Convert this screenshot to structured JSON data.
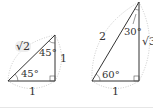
{
  "diagram": {
    "left_triangle": {
      "name": "45-45-90 triangle",
      "hypotenuse": "√2",
      "vertical_side": "1",
      "base": "1",
      "top_angle": "45°",
      "bottom_angle": "45°"
    },
    "right_triangle": {
      "name": "30-60-90 triangle",
      "hypotenuse": "2",
      "vertical_side": "√3",
      "base": "1",
      "top_angle": "30°",
      "bottom_angle": "60°"
    },
    "colors": {
      "line": "#333333",
      "dotted": "#bbbbbb",
      "label": "#333333"
    }
  }
}
